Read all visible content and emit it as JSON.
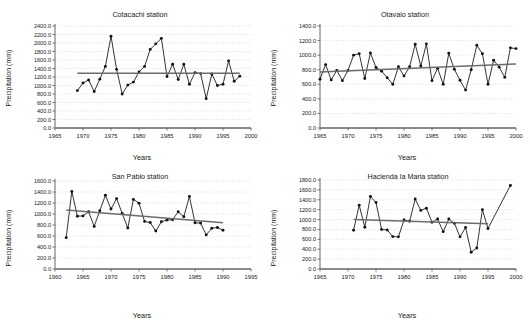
{
  "figure": {
    "panel_count": 4,
    "axis_label_x": "Years",
    "axis_label_y": "Precipitation (mm)"
  },
  "chart_data": [
    {
      "type": "line",
      "title": "Cotacachi station",
      "xlabel": "Years",
      "ylabel": "Precipitation (mm)",
      "xlim": [
        1965,
        2000
      ],
      "ylim": [
        0,
        2400
      ],
      "xticks": [
        1965,
        1970,
        1975,
        1980,
        1985,
        1990,
        1995,
        2000
      ],
      "yticks": [
        "0.0",
        "200.0",
        "400.0",
        "600.0",
        "800.0",
        "1000.0",
        "1200.0",
        "1400.0",
        "1600.0",
        "1800.0",
        "2000.0",
        "2200.0",
        "2400.0"
      ],
      "grid": true,
      "legend": "none",
      "x": [
        1969,
        1970,
        1971,
        1972,
        1973,
        1974,
        1975,
        1976,
        1977,
        1978,
        1979,
        1980,
        1981,
        1982,
        1983,
        1984,
        1985,
        1986,
        1987,
        1988,
        1989,
        1990,
        1991,
        1992,
        1993,
        1994,
        1995,
        1996,
        1997,
        1998
      ],
      "values": [
        880,
        1060,
        1130,
        860,
        1150,
        1450,
        2160,
        1380,
        800,
        1010,
        1080,
        1320,
        1450,
        1850,
        1980,
        2110,
        1210,
        1500,
        1140,
        1500,
        1030,
        1300,
        1280,
        690,
        1270,
        1000,
        1030,
        1580,
        1100,
        1220
      ],
      "trend": {
        "type": "linear",
        "x": [
          1969,
          1998
        ],
        "y": [
          1290,
          1290
        ]
      }
    },
    {
      "type": "line",
      "title": "Otavalo station",
      "xlabel": "Years",
      "ylabel": "Precipitation (mm)",
      "xlim": [
        1965,
        2000
      ],
      "ylim": [
        0,
        1400
      ],
      "xticks": [
        1965,
        1970,
        1975,
        1980,
        1985,
        1990,
        1995,
        2000
      ],
      "yticks": [
        "0.0",
        "200.0",
        "400.0",
        "600.0",
        "800.0",
        "1000.0",
        "1200.0",
        "1400.0"
      ],
      "grid": true,
      "legend": "none",
      "x": [
        1965,
        1966,
        1967,
        1968,
        1969,
        1970,
        1971,
        1972,
        1973,
        1974,
        1975,
        1976,
        1977,
        1978,
        1979,
        1980,
        1981,
        1982,
        1983,
        1984,
        1985,
        1986,
        1987,
        1988,
        1989,
        1990,
        1991,
        1992,
        1993,
        1994,
        1995,
        1996,
        1997,
        1998,
        1999,
        2000
      ],
      "values": [
        670,
        870,
        660,
        790,
        650,
        790,
        1000,
        1020,
        680,
        1030,
        830,
        780,
        690,
        600,
        840,
        715,
        840,
        1150,
        850,
        1155,
        650,
        820,
        600,
        1025,
        805,
        655,
        520,
        800,
        1135,
        1020,
        600,
        930,
        835,
        695,
        1100,
        1090
      ],
      "trend": {
        "type": "linear",
        "x": [
          1965,
          2000
        ],
        "y": [
          770,
          880
        ]
      }
    },
    {
      "type": "line",
      "title": "San Pablo station",
      "xlabel": "Years",
      "ylabel": "Precipitation (mm)",
      "xlim": [
        1960,
        1995
      ],
      "ylim": [
        0,
        1600
      ],
      "xticks": [
        1960,
        1965,
        1970,
        1975,
        1980,
        1985,
        1990,
        1995
      ],
      "yticks": [
        "0.0",
        "200.0",
        "400.0",
        "600.0",
        "800.0",
        "1000.0",
        "1200.0",
        "1400.0",
        "1600.0"
      ],
      "grid": true,
      "legend": "none",
      "x": [
        1962,
        1963,
        1964,
        1965,
        1966,
        1967,
        1968,
        1969,
        1970,
        1971,
        1972,
        1973,
        1974,
        1975,
        1976,
        1977,
        1978,
        1979,
        1980,
        1981,
        1982,
        1983,
        1984,
        1985,
        1986,
        1987,
        1988,
        1989,
        1990
      ],
      "values": [
        570,
        1410,
        960,
        965,
        1040,
        775,
        1060,
        1340,
        1090,
        1280,
        1010,
        745,
        1265,
        1195,
        865,
        845,
        690,
        860,
        890,
        895,
        1040,
        950,
        1320,
        840,
        835,
        620,
        740,
        755,
        705
      ],
      "trend": {
        "type": "linear",
        "x": [
          1962,
          1990
        ],
        "y": [
          1075,
          840
        ]
      }
    },
    {
      "type": "line",
      "title": "Hacienda la Maria station",
      "xlabel": "Years",
      "ylabel": "Precipitation (mm)",
      "xlim": [
        1965,
        2000
      ],
      "ylim": [
        0,
        1800
      ],
      "xticks": [
        1965,
        1970,
        1975,
        1980,
        1985,
        1990,
        1995,
        2000
      ],
      "yticks": [
        "0.0",
        "200.0",
        "400.0",
        "600.0",
        "800.0",
        "1000.0",
        "1200.0",
        "1400.0",
        "1600.0",
        "1800.0"
      ],
      "grid": true,
      "legend": "none",
      "x": [
        1971,
        1972,
        1973,
        1974,
        1975,
        1976,
        1977,
        1978,
        1979,
        1980,
        1981,
        1982,
        1983,
        1984,
        1985,
        1986,
        1987,
        1988,
        1989,
        1990,
        1991,
        1992,
        1993,
        1994,
        1995,
        1999
      ],
      "values": [
        785,
        1290,
        845,
        1465,
        1345,
        800,
        790,
        655,
        650,
        990,
        965,
        1415,
        1185,
        1230,
        945,
        1010,
        755,
        1010,
        925,
        650,
        840,
        340,
        425,
        1200,
        820,
        1690
      ],
      "trend": {
        "type": "linear",
        "x": [
          1971,
          1995
        ],
        "y": [
          1000,
          915
        ]
      }
    }
  ]
}
